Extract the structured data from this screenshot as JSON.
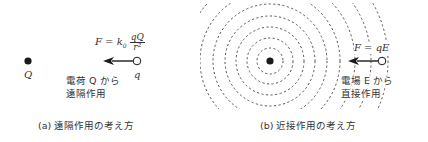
{
  "panel_a": {
    "source_charge_label": "Q",
    "test_charge_label": "q",
    "force_formula": {
      "lhs": "F = k",
      "subscript": "0",
      "numerator": "qQ",
      "denominator": "r²"
    },
    "description_line1": "電荷 Q から",
    "description_line2": "遠隔作用",
    "caption": "(a)  遠隔作用の考え方"
  },
  "panel_b": {
    "force_formula": "F = qE",
    "description_line1": "電場 E から",
    "description_line2": "直接作用",
    "caption": "(b)  近接作用の考え方",
    "field_ring_radii": [
      13,
      23,
      34,
      45,
      57,
      70,
      85,
      101,
      118
    ]
  },
  "colors": {
    "ink": "#222222",
    "dashed_ring": "#555555",
    "background": "#ffffff"
  }
}
